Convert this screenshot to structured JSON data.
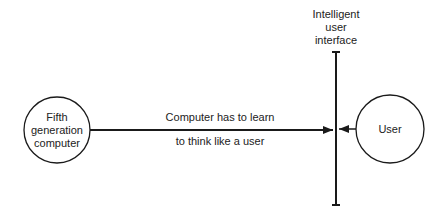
{
  "diagram": {
    "nodes": [
      {
        "id": "fifth-gen",
        "label_lines": [
          "Fifth",
          "generation",
          "computer"
        ],
        "shape": "circle"
      },
      {
        "id": "user",
        "label_lines": [
          "User"
        ],
        "shape": "circle"
      }
    ],
    "interface": {
      "label_lines": [
        "Intelligent",
        "user",
        "interface"
      ]
    },
    "edge": {
      "label_lines": [
        "Computer has to learn",
        "to think like a user"
      ]
    },
    "colors": {
      "stroke": "#1a1a1a",
      "background": "#ffffff"
    }
  }
}
